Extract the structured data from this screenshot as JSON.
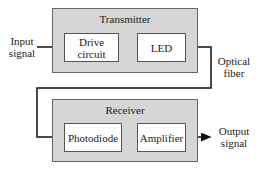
{
  "diagram": {
    "type": "block-diagram",
    "transmitter": {
      "title": "Transmitter",
      "blocks": [
        {
          "label": "Drive\ncircuit"
        },
        {
          "label": "LED"
        }
      ]
    },
    "receiver": {
      "title": "Receiver",
      "blocks": [
        {
          "label": "Photodiode"
        },
        {
          "label": "Amplifier"
        }
      ]
    },
    "labels": {
      "input": "Input\nsignal",
      "fiber": "Optical\nfiber",
      "output": "Output\nsignal"
    },
    "colors": {
      "group_fill": "#d6d6d6",
      "block_fill": "#ffffff",
      "line": "#111111"
    }
  }
}
